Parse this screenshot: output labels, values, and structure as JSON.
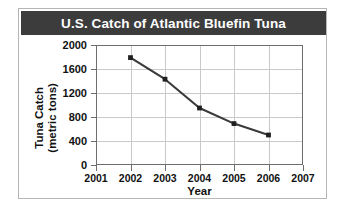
{
  "chart_data": {
    "type": "line",
    "title": "U.S. Catch of Atlantic Bluefin Tuna",
    "xlabel": "Year",
    "ylabel_line1": "Tuna Catch",
    "ylabel_line2": "(metric tons)",
    "x": [
      2002,
      2003,
      2004,
      2005,
      2006
    ],
    "values": [
      1790,
      1430,
      950,
      690,
      500
    ],
    "series": [
      {
        "name": "Tuna Catch",
        "x": [
          2002,
          2003,
          2004,
          2005,
          2006
        ],
        "values": [
          1790,
          1430,
          950,
          690,
          500
        ]
      }
    ],
    "xlim": [
      2001,
      2007
    ],
    "ylim": [
      0,
      2000
    ],
    "xticks": [
      2001,
      2002,
      2003,
      2004,
      2005,
      2006,
      2007
    ],
    "xtick_labels": [
      "2001",
      "2002",
      "2003",
      "2004",
      "2005",
      "2006",
      "2007"
    ],
    "yticks": [
      0,
      400,
      800,
      1200,
      1600,
      2000
    ],
    "ytick_labels": [
      "0",
      "400",
      "800",
      "1200",
      "1600",
      "2000"
    ],
    "grid": true,
    "legend": false,
    "marker": "square",
    "line_color": "#3a3a3a",
    "marker_color": "#1f1f1f",
    "grid_color": "#c9c9c9",
    "axis_color": "#6e6e6e",
    "title_background": "#3c3c3c",
    "title_color": "#ffffff",
    "plot_background": "#ffffff"
  }
}
